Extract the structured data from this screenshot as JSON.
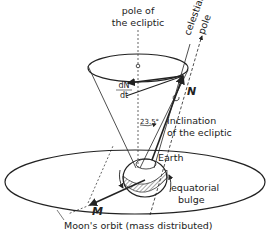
{
  "diagram": {
    "labels": {
      "pole_ecliptic_1": "pole of",
      "pole_ecliptic_2": "the ecliptic",
      "celestial_pole_1": "celestial",
      "celestial_pole_2": "pole",
      "dN_num": "dN",
      "dN_den": "dt",
      "N": "N",
      "angle": "23.5°",
      "inclination_1": "inclination",
      "inclination_2": "of the ecliptic",
      "earth": "Earth",
      "bulge_1": "equatorial",
      "bulge_2": "bulge",
      "M": "M",
      "moon_orbit": "Moon's orbit (mass distributed)"
    },
    "colors": {
      "ink": "#222222",
      "background": "#ffffff"
    }
  }
}
